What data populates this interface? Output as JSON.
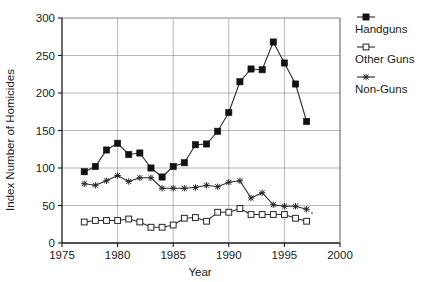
{
  "chart_data": {
    "type": "line",
    "title": "",
    "xlabel": "Year",
    "ylabel": "Index Number of Homicides",
    "xlim": [
      1975,
      2000
    ],
    "ylim": [
      0,
      300
    ],
    "xticks": [
      1975,
      1980,
      1985,
      1990,
      1995,
      2000
    ],
    "yticks": [
      0,
      50,
      100,
      150,
      200,
      250,
      300
    ],
    "grid": true,
    "legend_position": "right",
    "x": [
      1977,
      1978,
      1979,
      1980,
      1981,
      1982,
      1983,
      1984,
      1985,
      1986,
      1987,
      1988,
      1989,
      1990,
      1991,
      1992,
      1993,
      1994,
      1995,
      1996,
      1997
    ],
    "series": [
      {
        "name": "Handguns",
        "marker": "filled-square",
        "values": [
          95,
          102,
          124,
          133,
          118,
          120,
          100,
          88,
          102,
          107,
          131,
          132,
          149,
          174,
          215,
          232,
          231,
          268,
          240,
          212,
          162
        ]
      },
      {
        "name": "Other Guns",
        "marker": "open-square",
        "values": [
          28,
          30,
          30,
          30,
          32,
          28,
          21,
          21,
          24,
          33,
          34,
          29,
          41,
          41,
          46,
          38,
          38,
          38,
          38,
          33,
          29
        ]
      },
      {
        "name": "Non-Guns",
        "marker": "star",
        "values": [
          79,
          77,
          83,
          90,
          82,
          87,
          87,
          73,
          73,
          73,
          74,
          77,
          75,
          81,
          83,
          60,
          67,
          51,
          49,
          49,
          45
        ]
      }
    ]
  },
  "legend": {
    "items": [
      {
        "label": "Handguns",
        "marker": "filled-square"
      },
      {
        "label": "Other Guns",
        "marker": "open-square"
      },
      {
        "label": "Non-Guns",
        "marker": "star"
      }
    ]
  },
  "axes": {
    "x_title": "Year",
    "y_title": "Index Number of Homicides",
    "x_tick_labels": [
      "1975",
      "1980",
      "1985",
      "1990",
      "1995",
      "2000"
    ],
    "y_tick_labels": [
      "0",
      "50",
      "100",
      "150",
      "200",
      "250",
      "300"
    ]
  }
}
